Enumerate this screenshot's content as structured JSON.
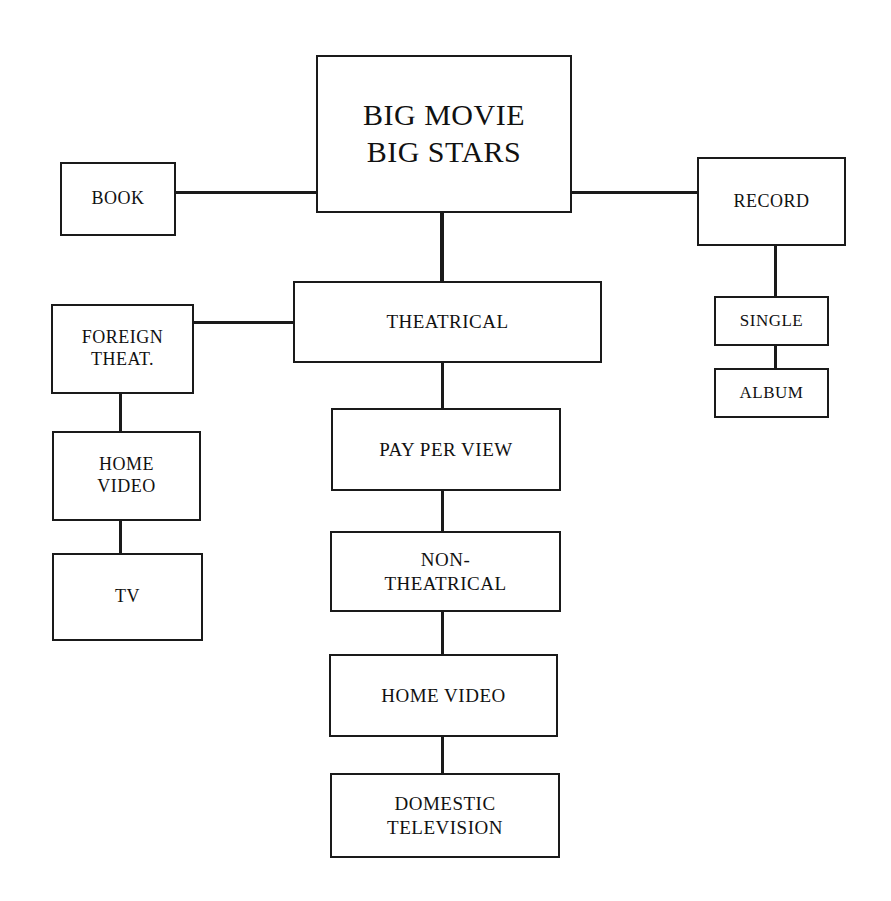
{
  "diagram": {
    "type": "tree-hierarchy",
    "line_color": "#1a1a1a",
    "box_fill": "#ffffff",
    "nodes": [
      {
        "id": "root",
        "label": "BIG MOVIE\nBIG STARS",
        "x": 316,
        "y": 55,
        "w": 256,
        "h": 158,
        "size": "root"
      },
      {
        "id": "book",
        "label": "BOOK",
        "x": 60,
        "y": 162,
        "w": 116,
        "h": 74,
        "size": "md"
      },
      {
        "id": "record",
        "label": "RECORD",
        "x": 697,
        "y": 157,
        "w": 149,
        "h": 89,
        "size": "md"
      },
      {
        "id": "single",
        "label": "SINGLE",
        "x": 714,
        "y": 296,
        "w": 115,
        "h": 50,
        "size": "sm"
      },
      {
        "id": "album",
        "label": "ALBUM",
        "x": 714,
        "y": 368,
        "w": 115,
        "h": 50,
        "size": "sm"
      },
      {
        "id": "theatrical",
        "label": "THEATRICAL",
        "x": 293,
        "y": 281,
        "w": 309,
        "h": 82,
        "size": "lg"
      },
      {
        "id": "foreign-theat",
        "label": "FOREIGN\nTHEAT.",
        "x": 51,
        "y": 304,
        "w": 143,
        "h": 90,
        "size": "md"
      },
      {
        "id": "home-video-left",
        "label": "HOME\nVIDEO",
        "x": 52,
        "y": 431,
        "w": 149,
        "h": 90,
        "size": "md"
      },
      {
        "id": "tv",
        "label": "TV",
        "x": 52,
        "y": 553,
        "w": 151,
        "h": 88,
        "size": "md"
      },
      {
        "id": "pay-per-view",
        "label": "PAY PER VIEW",
        "x": 331,
        "y": 408,
        "w": 230,
        "h": 83,
        "size": "lg"
      },
      {
        "id": "non-theatrical",
        "label": "NON-\nTHEATRICAL",
        "x": 330,
        "y": 531,
        "w": 231,
        "h": 81,
        "size": "lg"
      },
      {
        "id": "home-video-mid",
        "label": "HOME VIDEO",
        "x": 329,
        "y": 654,
        "w": 229,
        "h": 83,
        "size": "lg"
      },
      {
        "id": "domestic-tv",
        "label": "DOMESTIC\nTELEVISION",
        "x": 330,
        "y": 773,
        "w": 230,
        "h": 85,
        "size": "lg"
      }
    ],
    "edges": [
      {
        "id": "book-root",
        "from": "book",
        "to": "root",
        "orient": "h",
        "x": 176,
        "y": 192,
        "len": 141,
        "thick": 3
      },
      {
        "id": "root-record",
        "from": "root",
        "to": "record",
        "orient": "h",
        "x": 571,
        "y": 192,
        "len": 127,
        "thick": 3
      },
      {
        "id": "record-single",
        "from": "record",
        "to": "single",
        "orient": "v",
        "x": 775,
        "y": 245,
        "len": 52,
        "thick": 3
      },
      {
        "id": "single-album",
        "from": "single",
        "to": "album",
        "orient": "v",
        "x": 775,
        "y": 345,
        "len": 25,
        "thick": 3
      },
      {
        "id": "root-theatrical",
        "from": "root",
        "to": "theatrical",
        "orient": "v",
        "x": 442,
        "y": 212,
        "len": 70,
        "thick": 4
      },
      {
        "id": "foreign-theat-theatrical",
        "from": "foreign-theat",
        "to": "theatrical",
        "orient": "h",
        "x": 193,
        "y": 322,
        "len": 101,
        "thick": 3
      },
      {
        "id": "foreign-theat-home-video",
        "from": "foreign-theat",
        "to": "home-video-left",
        "orient": "v",
        "x": 120,
        "y": 393,
        "len": 39,
        "thick": 3
      },
      {
        "id": "home-video-tv",
        "from": "home-video-left",
        "to": "tv",
        "orient": "v",
        "x": 120,
        "y": 520,
        "len": 34,
        "thick": 3
      },
      {
        "id": "theatrical-pay-per-view",
        "from": "theatrical",
        "to": "pay-per-view",
        "orient": "v",
        "x": 442,
        "y": 362,
        "len": 47,
        "thick": 3
      },
      {
        "id": "pay-per-view-non-theatrical",
        "from": "pay-per-view",
        "to": "non-theatrical",
        "orient": "v",
        "x": 442,
        "y": 490,
        "len": 42,
        "thick": 3
      },
      {
        "id": "non-theatrical-home-video",
        "from": "non-theatrical",
        "to": "home-video-mid",
        "orient": "v",
        "x": 442,
        "y": 611,
        "len": 44,
        "thick": 3
      },
      {
        "id": "home-video-domestic-tv",
        "from": "home-video-mid",
        "to": "domestic-tv",
        "orient": "v",
        "x": 442,
        "y": 736,
        "len": 38,
        "thick": 3
      }
    ]
  }
}
